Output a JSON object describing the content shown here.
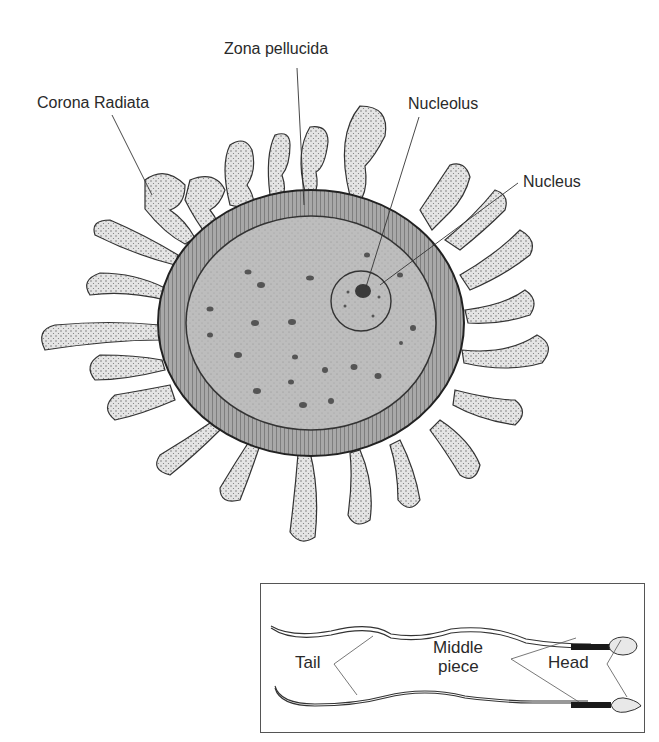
{
  "egg_diagram": {
    "labels": {
      "zona_pellucida": "Zona pellucida",
      "corona_radiata": "Corona Radiata",
      "nucleolus": "Nucleolus",
      "nucleus": "Nucleus"
    },
    "colors": {
      "cytoplasm": "#b8b8b8",
      "zona": "#9a9a9a",
      "outline": "#333333",
      "cells": "#d9d9d9"
    }
  },
  "sperm_diagram": {
    "labels": {
      "tail": "Tail",
      "middle_piece_line1": "Middle",
      "middle_piece_line2": "piece",
      "head": "Head"
    }
  }
}
